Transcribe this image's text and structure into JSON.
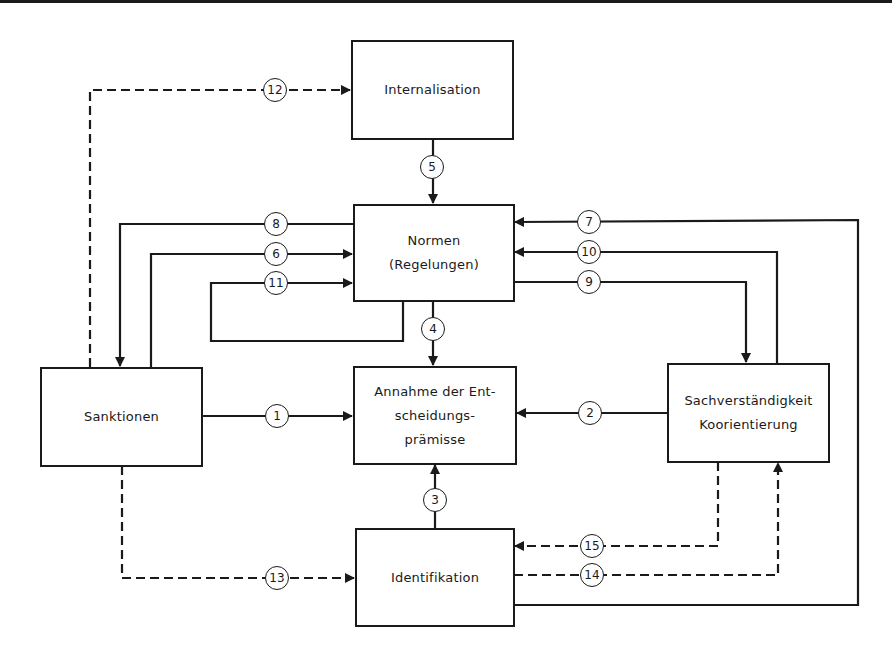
{
  "diagram": {
    "nodes": {
      "internalisation": "Internalisation",
      "normen": "Normen\n(Regelungen)",
      "annahme": "Annahme der Ent-\nscheidungs-\nprämisse",
      "sanktionen": "Sanktionen",
      "sachverstaendigkeit": "Sachverständigkeit\nKoorientierung",
      "identifikation": "Identifikation"
    },
    "edges": [
      {
        "label": "1",
        "from": "Sanktionen",
        "to": "Annahme der Entscheidungsprämisse",
        "style": "solid"
      },
      {
        "label": "2",
        "from": "Sachverständigkeit Koorientierung",
        "to": "Annahme der Entscheidungsprämisse",
        "style": "solid"
      },
      {
        "label": "3",
        "from": "Identifikation",
        "to": "Annahme der Entscheidungsprämisse",
        "style": "solid"
      },
      {
        "label": "4",
        "from": "Normen (Regelungen)",
        "to": "Annahme der Entscheidungsprämisse",
        "style": "solid"
      },
      {
        "label": "5",
        "from": "Internalisation",
        "to": "Normen (Regelungen)",
        "style": "solid"
      },
      {
        "label": "6",
        "from": "Sanktionen",
        "to": "Normen (Regelungen)",
        "style": "solid"
      },
      {
        "label": "7",
        "from": "Identifikation",
        "to": "Normen (Regelungen)",
        "style": "solid"
      },
      {
        "label": "8",
        "from": "Normen (Regelungen)",
        "to": "Sanktionen",
        "style": "solid"
      },
      {
        "label": "9",
        "from": "Normen (Regelungen)",
        "to": "Sachverständigkeit Koorientierung",
        "style": "solid"
      },
      {
        "label": "10",
        "from": "Sachverständigkeit Koorientierung",
        "to": "Normen (Regelungen)",
        "style": "solid"
      },
      {
        "label": "11",
        "from": "Normen (Regelungen)",
        "to": "Normen (Regelungen)",
        "style": "solid"
      },
      {
        "label": "12",
        "from": "Sanktionen",
        "to": "Internalisation",
        "style": "dashed"
      },
      {
        "label": "13",
        "from": "Sanktionen",
        "to": "Identifikation",
        "style": "dashed"
      },
      {
        "label": "14",
        "from": "Identifikation",
        "to": "Sachverständigkeit Koorientierung",
        "style": "dashed"
      },
      {
        "label": "15",
        "from": "Sachverständigkeit Koorientierung",
        "to": "Identifikation",
        "style": "dashed"
      }
    ],
    "badges": {
      "b1": "1",
      "b2": "2",
      "b3": "3",
      "b4": "4",
      "b5": "5",
      "b6": "6",
      "b7": "7",
      "b8": "8",
      "b9": "9",
      "b10": "10",
      "b11": "11",
      "b12": "12",
      "b13": "13",
      "b14": "14",
      "b15": "15"
    },
    "colors": {
      "ink": "#1a1a1a",
      "background": "#ffffff"
    }
  }
}
